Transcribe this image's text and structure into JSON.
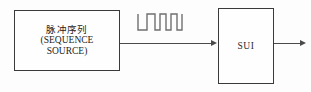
{
  "diagram": {
    "type": "block-diagram",
    "background_color": "#fdfdfd",
    "line_color": "#4a4a4a",
    "border_color": "#3a3a3a",
    "blocks": [
      {
        "id": "source",
        "label_cn": "脉冲序列",
        "label_en_line1": "(SEQUENCE",
        "label_en_line2": "SOURCE)"
      },
      {
        "id": "sui",
        "label": "SUI"
      }
    ],
    "connections": [
      {
        "id": "source-to-sui",
        "from": "source",
        "to": "sui",
        "arrow": "right"
      },
      {
        "id": "sui-output",
        "from": "sui",
        "to": "",
        "arrow": "right"
      }
    ],
    "annotations": [
      {
        "id": "pulse-waveform",
        "kind": "square-wave",
        "pulse_count": 3,
        "description": "pulse train signal symbol"
      }
    ]
  }
}
